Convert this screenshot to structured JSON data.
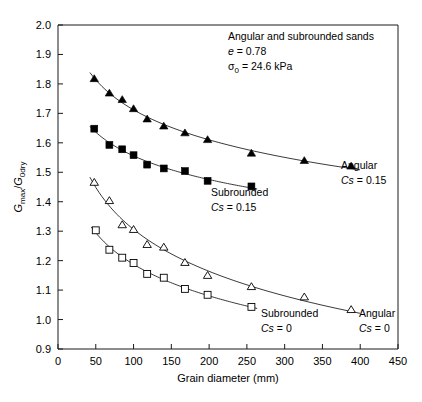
{
  "chart_data": {
    "type": "scatter",
    "title": "",
    "xlabel": "Grain diameter (mm)",
    "ylabel": "Gmax/G0dry",
    "ylabel_parts": {
      "base1": "G",
      "sub1": "max",
      "slash": "/",
      "base2": "G",
      "sub2": "0dry"
    },
    "xlim": [
      0,
      450
    ],
    "ylim": [
      0.9,
      2.0
    ],
    "xticks": [
      0,
      50,
      100,
      150,
      200,
      250,
      300,
      350,
      400,
      450
    ],
    "yticks": [
      0.9,
      1.0,
      1.1,
      1.2,
      1.3,
      1.4,
      1.5,
      1.6,
      1.7,
      1.8,
      1.9,
      2.0
    ],
    "xtick_labels": [
      "0",
      "50",
      "100",
      "150",
      "200",
      "250",
      "300",
      "350",
      "400",
      "450"
    ],
    "ytick_labels": [
      "0.9",
      "1.0",
      "1.1",
      "1.2",
      "1.3",
      "1.4",
      "1.5",
      "1.6",
      "1.7",
      "1.8",
      "1.9",
      "2.0"
    ],
    "grid": false,
    "legend_position": "inline-annotations",
    "annotations": [
      {
        "id": "cond-line-1",
        "text": "Angular and subrounded sands"
      },
      {
        "id": "cond-line-2",
        "text": "e = 0.78",
        "italic_lead": "e"
      },
      {
        "id": "cond-line-3",
        "text": "σ0 = 24.6 kPa",
        "symbol": "σ",
        "subscript": "0",
        "value": "= 24.6 kPa"
      }
    ],
    "series": [
      {
        "name": "Angular Cs = 0.15",
        "label_line1": "Angular",
        "label_line2": "Cs = 0.15",
        "label_italic": "Cs",
        "label_rest": "= 0.15",
        "marker": "filled-triangle",
        "x": [
          48,
          68,
          85,
          100,
          118,
          140,
          168,
          198,
          256,
          326,
          388
        ],
        "y": [
          1.818,
          1.769,
          1.747,
          1.716,
          1.681,
          1.657,
          1.634,
          1.611,
          1.565,
          1.54,
          1.521
        ]
      },
      {
        "name": "Subrounded Cs = 0.15",
        "label_line1": "Subrounded",
        "label_line2": "Cs = 0.15",
        "label_italic": "Cs",
        "label_rest": "= 0.15",
        "marker": "filled-square",
        "x": [
          48,
          68,
          85,
          100,
          118,
          140,
          168,
          198,
          256
        ],
        "y": [
          1.648,
          1.593,
          1.578,
          1.558,
          1.526,
          1.513,
          1.504,
          1.471,
          1.452
        ]
      },
      {
        "name": "Angular Cs = 0",
        "label_line1": "Angular",
        "label_line2": "Cs = 0",
        "label_italic": "Cs",
        "label_rest": "= 0",
        "marker": "open-triangle",
        "x": [
          48,
          68,
          85,
          100,
          118,
          140,
          168,
          198,
          256,
          326,
          388
        ],
        "y": [
          1.466,
          1.404,
          1.322,
          1.306,
          1.255,
          1.246,
          1.194,
          1.15,
          1.112,
          1.077,
          1.034
        ]
      },
      {
        "name": "Subrounded Cs = 0",
        "label_line1": "Subrounded",
        "label_line2": "Cs = 0",
        "label_italic": "Cs",
        "label_rest": "= 0",
        "marker": "open-square",
        "x": [
          50,
          68,
          85,
          100,
          118,
          140,
          168,
          198,
          256
        ],
        "y": [
          1.303,
          1.237,
          1.21,
          1.192,
          1.155,
          1.142,
          1.104,
          1.084,
          1.043
        ]
      }
    ]
  }
}
